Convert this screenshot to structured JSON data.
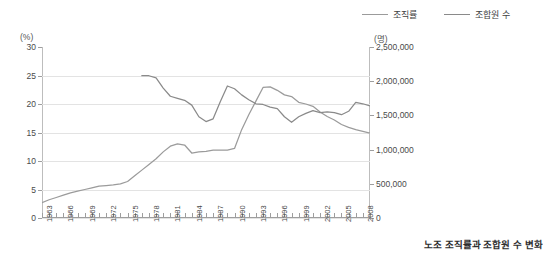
{
  "caption": "노조 조직률과 조합원 수 변화",
  "legend": {
    "position": "top-right",
    "items": [
      {
        "label": "조직률",
        "color": "#9b9b9b",
        "key": "rate"
      },
      {
        "label": "조합원 수",
        "color": "#8a8a8a",
        "key": "members"
      }
    ]
  },
  "axes": {
    "left_unit": "(%)",
    "right_unit": "(명)",
    "left_ticks": [
      "30",
      "25",
      "20",
      "15",
      "10",
      "5",
      "0"
    ],
    "right_ticks": [
      "2,500,000",
      "2,000,000",
      "1,500,000",
      "1,000,000",
      "500,000",
      "0"
    ]
  },
  "chart_data": {
    "type": "line",
    "title": "노조 조직률과 조합원 수 변화",
    "xlabel": "",
    "ylabel": "조직률 (%)",
    "y2label": "조합원 수 (명)",
    "ylim": [
      0,
      30
    ],
    "y2lim": [
      0,
      2500000
    ],
    "xlim": [
      1963,
      2009
    ],
    "grid": true,
    "legend_position": "top-right",
    "tick_labels_x": [
      "1963",
      "1966",
      "1969",
      "1972",
      "1975",
      "1978",
      "1981",
      "1984",
      "1987",
      "1990",
      "1993",
      "1996",
      "1999",
      "2002",
      "2005",
      "2008"
    ],
    "tick_labels_y": [
      "0",
      "5",
      "10",
      "15",
      "20",
      "25",
      "30"
    ],
    "tick_labels_y2": [
      "0",
      "500,000",
      "1,000,000",
      "1,500,000",
      "2,000,000",
      "2,500,000"
    ],
    "x": [
      1963,
      1964,
      1965,
      1966,
      1967,
      1968,
      1969,
      1970,
      1971,
      1972,
      1973,
      1974,
      1975,
      1976,
      1977,
      1978,
      1979,
      1980,
      1981,
      1982,
      1983,
      1984,
      1985,
      1986,
      1987,
      1988,
      1989,
      1990,
      1991,
      1992,
      1993,
      1994,
      1995,
      1996,
      1997,
      1998,
      1999,
      2000,
      2001,
      2002,
      2003,
      2004,
      2005,
      2006,
      2007,
      2008,
      2009
    ],
    "series": [
      {
        "name": "조직률",
        "unit": "%",
        "axis": "left",
        "color": "#9b9b9b",
        "values": [
          2.7,
          3.2,
          3.6,
          4.0,
          4.4,
          4.7,
          5.0,
          5.3,
          5.6,
          5.7,
          5.8,
          6.0,
          6.4,
          7.4,
          8.4,
          9.4,
          10.4,
          11.6,
          12.6,
          13.0,
          12.8,
          11.4,
          11.6,
          11.7,
          11.9,
          11.9,
          11.9,
          12.2,
          15.5,
          18.1,
          20.5,
          22.9,
          23.0,
          22.4,
          21.6,
          21.3,
          20.3,
          20.0,
          19.6,
          18.6,
          17.8,
          17.2,
          16.4,
          15.9,
          15.5,
          15.2,
          14.9
        ],
        "note": "drawn as the long rising-then-falling line; plotted left axis"
      },
      {
        "name": "조합원 수",
        "unit": "명",
        "axis": "right",
        "color": "#8a8a8a",
        "start_year": 1977,
        "values": [
          null,
          null,
          null,
          null,
          null,
          null,
          null,
          null,
          null,
          null,
          null,
          null,
          null,
          null,
          2080000,
          2080000,
          2050000,
          1900000,
          1780000,
          1750000,
          1720000,
          1650000,
          1480000,
          1410000,
          1450000,
          1700000,
          1930000,
          1890000,
          1800000,
          1730000,
          1670000,
          1660000,
          1620000,
          1600000,
          1480000,
          1400000,
          1480000,
          1530000,
          1570000,
          1540000,
          1550000,
          1540000,
          1510000,
          1560000,
          1690000,
          1670000,
          1640000
        ],
        "note": "starts abruptly at 1977 near 2,080,000 on the right axis"
      }
    ]
  }
}
